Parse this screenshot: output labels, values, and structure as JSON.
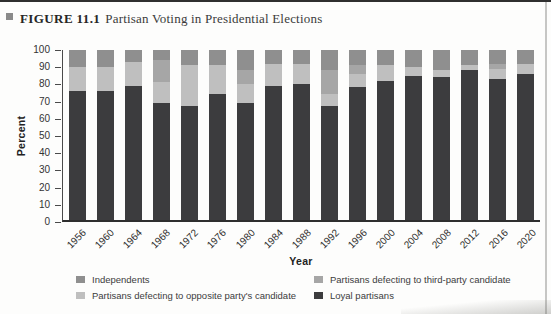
{
  "page": {
    "figure_label": "FIGURE 11.1",
    "figure_title": "Partisan Voting in Presidential Elections",
    "bullet_color": "#8a8a8a"
  },
  "axes": {
    "y_title": "Percent",
    "x_title": "Year",
    "y_ticks": [
      0,
      10,
      20,
      30,
      40,
      50,
      60,
      70,
      80,
      90,
      100
    ]
  },
  "legend": {
    "items": [
      {
        "label": "Independents",
        "color": "#8f8f8f"
      },
      {
        "label": "Partisans defecting to third-party candidate",
        "color": "#a6a6a6"
      },
      {
        "label": "Partisans defecting to opposite party's candidate",
        "color": "#bfbfbf"
      },
      {
        "label": "Loyal partisans",
        "color": "#3c3c3e"
      }
    ]
  },
  "chart_data": {
    "type": "bar",
    "subtype": "stacked-vertical",
    "title": "Partisan Voting in Presidential Elections",
    "xlabel": "Year",
    "ylabel": "Percent",
    "ylim": [
      0,
      100
    ],
    "grid": false,
    "legend_position": "bottom",
    "categories": [
      "1956",
      "1960",
      "1964",
      "1968",
      "1972",
      "1976",
      "1980",
      "1984",
      "1988",
      "1992",
      "1996",
      "2000",
      "2004",
      "2008",
      "2012",
      "2016",
      "2020"
    ],
    "series": [
      {
        "name": "Loyal partisans",
        "color": "#3c3c3e",
        "values": [
          76,
          76,
          79,
          69,
          67,
          74,
          69,
          79,
          80,
          67,
          78,
          82,
          85,
          84,
          88,
          83,
          86
        ]
      },
      {
        "name": "Partisans defecting to opposite party's candidate",
        "color": "#bfbfbf",
        "values": [
          14,
          14,
          14,
          12,
          24,
          17,
          11,
          13,
          12,
          7,
          8,
          9,
          5,
          4,
          3,
          6,
          6
        ]
      },
      {
        "name": "Partisans defecting to third-party candidate",
        "color": "#a6a6a6",
        "values": [
          0,
          0,
          0,
          13,
          0,
          0,
          8,
          0,
          0,
          14,
          5,
          0,
          0,
          0,
          0,
          3,
          0
        ]
      },
      {
        "name": "Independents",
        "color": "#8f8f8f",
        "values": [
          10,
          10,
          7,
          6,
          9,
          9,
          12,
          8,
          8,
          12,
          9,
          9,
          10,
          12,
          9,
          8,
          8
        ]
      }
    ]
  }
}
